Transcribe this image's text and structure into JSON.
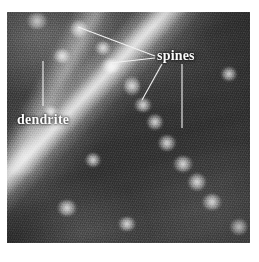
{
  "figure": {
    "kind": "photomicrograph",
    "modality": "fluorescence-microscopy",
    "color_mode": "grayscale",
    "plate": {
      "x": 7,
      "y": 12,
      "width": 243,
      "height": 231
    }
  },
  "annotations": {
    "labels": [
      {
        "id": "spines",
        "text": "spines",
        "x": 157,
        "y": 49,
        "color": "#fbfbfb",
        "weight": "bold",
        "font_px": 14
      },
      {
        "id": "dendrite",
        "text": "dendrite",
        "x": 17,
        "y": 113,
        "color": "#fbfbfb",
        "weight": "bold",
        "font_px": 14
      }
    ],
    "leader_lines": [
      {
        "id": "leader-spine-1",
        "label": "spines",
        "x1": 155,
        "y1": 56,
        "x2": 78,
        "y2": 27,
        "color": "#f2f2f2"
      },
      {
        "id": "leader-spine-2",
        "label": "spines",
        "x1": 155,
        "y1": 58,
        "x2": 110,
        "y2": 63,
        "color": "#f2f2f2"
      },
      {
        "id": "leader-spine-3",
        "label": "spines",
        "x1": 162,
        "y1": 64,
        "x2": 142,
        "y2": 100,
        "color": "#f2f2f2"
      },
      {
        "id": "leader-spine-4",
        "label": "spines",
        "x1": 182,
        "y1": 64,
        "x2": 182,
        "y2": 128,
        "color": "#f2f2f2"
      },
      {
        "id": "leader-dendrite",
        "label": "dendrite",
        "x1": 43,
        "y1": 61,
        "x2": 43,
        "y2": 106,
        "color": "#f2f2f2"
      }
    ]
  },
  "scan_artifacts": {
    "top_band_text": "",
    "bottom_band_text": "",
    "note": "faint illegible bleed-through marks above and below the plate"
  },
  "palette": {
    "page_background": "#ffffff",
    "field_dark": "#333333",
    "field_mid": "#4a4a4a",
    "structure_bright": "#e8e8e8",
    "annotation": "#fbfbfb"
  },
  "structures": {
    "shaft": {
      "orientation_deg": 134,
      "description": "main dendrite shaft running upper-left to lower-right"
    },
    "spine_blobs": [
      {
        "cx": 30,
        "cy": 9,
        "rx": 11,
        "ry": 8
      },
      {
        "cx": 72,
        "cy": 17,
        "rx": 9,
        "ry": 9
      },
      {
        "cx": 96,
        "cy": 36,
        "rx": 8,
        "ry": 7
      },
      {
        "cx": 104,
        "cy": 54,
        "rx": 10,
        "ry": 7
      },
      {
        "cx": 125,
        "cy": 74,
        "rx": 8,
        "ry": 10
      },
      {
        "cx": 136,
        "cy": 93,
        "rx": 9,
        "ry": 7
      },
      {
        "cx": 148,
        "cy": 110,
        "rx": 8,
        "ry": 8
      },
      {
        "cx": 160,
        "cy": 131,
        "rx": 9,
        "ry": 8
      },
      {
        "cx": 176,
        "cy": 152,
        "rx": 10,
        "ry": 8
      },
      {
        "cx": 190,
        "cy": 170,
        "rx": 9,
        "ry": 9
      },
      {
        "cx": 205,
        "cy": 190,
        "rx": 10,
        "ry": 8
      },
      {
        "cx": 55,
        "cy": 44,
        "rx": 9,
        "ry": 7
      },
      {
        "cx": 44,
        "cy": 100,
        "rx": 7,
        "ry": 6
      },
      {
        "cx": 86,
        "cy": 148,
        "rx": 8,
        "ry": 7
      },
      {
        "cx": 60,
        "cy": 196,
        "rx": 10,
        "ry": 8
      },
      {
        "cx": 120,
        "cy": 212,
        "rx": 9,
        "ry": 7
      },
      {
        "cx": 222,
        "cy": 62,
        "rx": 8,
        "ry": 7
      },
      {
        "cx": 232,
        "cy": 215,
        "rx": 9,
        "ry": 8
      }
    ]
  }
}
